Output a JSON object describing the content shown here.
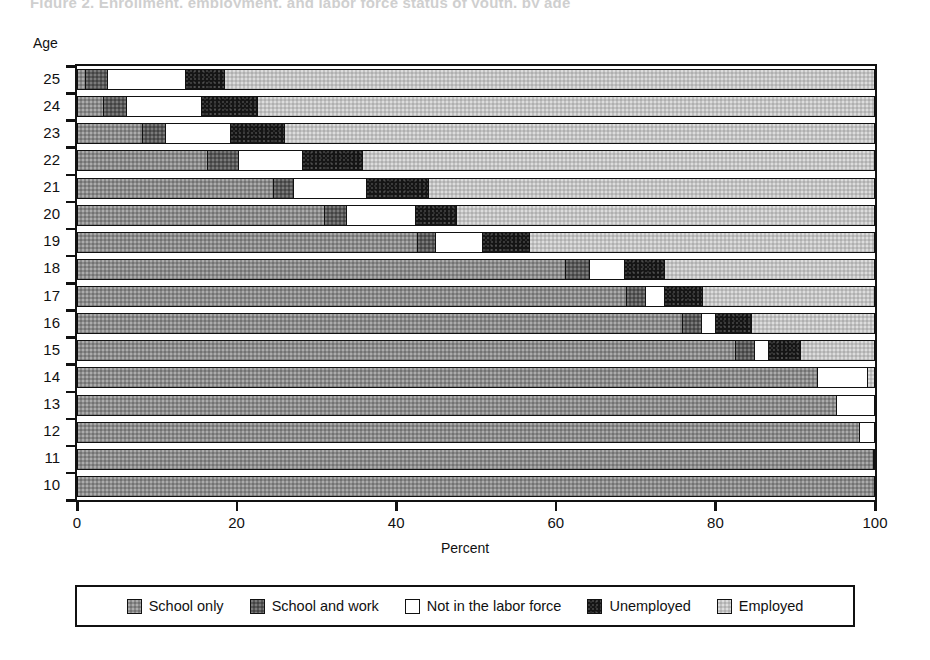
{
  "page": {
    "title_remnant": "Figure 2.  Enrollment, employment, and labor force status of youth, by age",
    "background": "#ffffff"
  },
  "axes": {
    "y_title": "Age",
    "x_title": "Percent",
    "x_ticks": [
      0,
      20,
      40,
      60,
      80,
      100
    ]
  },
  "legend": {
    "items": [
      {
        "label": "School only",
        "color": "#8a8a8a",
        "key": "school_only"
      },
      {
        "label": "School and work",
        "color": "#585858",
        "key": "school_and_work"
      },
      {
        "label": "Not in the labor force",
        "color": "#ffffff",
        "key": "not_in_labor_force"
      },
      {
        "label": "Unemployed",
        "color": "#151515",
        "key": "unemployed"
      },
      {
        "label": "Employed",
        "color": "#c2c2c2",
        "key": "employed"
      }
    ]
  },
  "chart_data": {
    "type": "bar",
    "orientation": "horizontal",
    "stacked": true,
    "title": "",
    "xlabel": "Percent",
    "ylabel": "Age",
    "xlim": [
      0,
      100
    ],
    "grid": false,
    "legend_position": "bottom",
    "categories": [
      "25",
      "24",
      "23",
      "22",
      "21",
      "20",
      "19",
      "18",
      "17",
      "16",
      "15",
      "14",
      "13",
      "12",
      "11",
      "10"
    ],
    "series": [
      {
        "name": "School only",
        "color": "#8a8a8a",
        "values": [
          1.0,
          3.2,
          8.1,
          16.3,
          24.5,
          30.9,
          42.6,
          61.2,
          68.8,
          75.8,
          82.5,
          92.7,
          95.1,
          98.0,
          99.7,
          100.0
        ]
      },
      {
        "name": "School and work",
        "color": "#585858",
        "values": [
          2.8,
          3.0,
          2.9,
          3.9,
          2.6,
          2.8,
          2.3,
          2.9,
          2.4,
          2.4,
          2.3,
          0.0,
          0.0,
          0.0,
          0.0,
          0.0
        ]
      },
      {
        "name": "Not in the labor force",
        "color": "#ffffff",
        "values": [
          9.7,
          9.4,
          8.2,
          8.0,
          9.1,
          8.6,
          5.8,
          4.5,
          2.3,
          1.8,
          1.8,
          6.3,
          4.9,
          2.0,
          0.3,
          0.0
        ]
      },
      {
        "name": "Unemployed",
        "color": "#151515",
        "values": [
          4.9,
          6.9,
          6.8,
          7.5,
          7.8,
          5.2,
          5.9,
          4.9,
          4.8,
          4.5,
          4.0,
          0.0,
          0.0,
          0.0,
          0.0,
          0.0
        ]
      },
      {
        "name": "Employed",
        "color": "#c2c2c2",
        "values": [
          81.6,
          77.5,
          74.0,
          64.3,
          56.0,
          52.5,
          43.4,
          26.5,
          21.7,
          15.5,
          9.4,
          1.0,
          0.0,
          0.0,
          0.0,
          0.0
        ]
      }
    ]
  }
}
